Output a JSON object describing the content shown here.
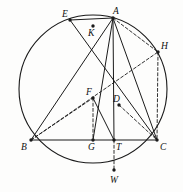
{
  "figure": {
    "background_color": "#fdfdfc",
    "stroke_color": "#1a1a1a",
    "label_color": "#101010"
  },
  "circle": {
    "center_x": 93,
    "center_y": 89,
    "radius": 74,
    "style": "solid"
  },
  "points": [
    {
      "id": "E",
      "label": "E",
      "x": 70,
      "y": 20,
      "label_x": 62,
      "label_y": 10,
      "on_circle": true
    },
    {
      "id": "A",
      "label": "A",
      "x": 113,
      "y": 18,
      "label_x": 113,
      "label_y": 7,
      "on_circle": true
    },
    {
      "id": "K",
      "label": "K",
      "x": 93,
      "y": 26,
      "label_x": 88,
      "label_y": 29,
      "on_circle": false
    },
    {
      "id": "H",
      "label": "H",
      "x": 158,
      "y": 52,
      "label_x": 161,
      "label_y": 42,
      "on_circle": true
    },
    {
      "id": "F",
      "label": "F",
      "x": 93,
      "y": 98,
      "label_x": 86,
      "label_y": 88,
      "on_circle": false
    },
    {
      "id": "D",
      "label": "D",
      "x": 119,
      "y": 105,
      "label_x": 113,
      "label_y": 95,
      "on_circle": false
    },
    {
      "id": "B",
      "label": "B",
      "x": 31,
      "y": 140,
      "label_x": 21,
      "label_y": 143,
      "on_circle": true
    },
    {
      "id": "G",
      "label": "G",
      "x": 93,
      "y": 140,
      "label_x": 88,
      "label_y": 143,
      "on_circle": false
    },
    {
      "id": "T",
      "label": "T",
      "x": 114,
      "y": 140,
      "label_x": 116,
      "label_y": 143,
      "on_circle": false
    },
    {
      "id": "C",
      "label": "C",
      "x": 157,
      "y": 140,
      "label_x": 160,
      "label_y": 143,
      "on_circle": true
    },
    {
      "id": "W",
      "label": "W",
      "x": 114,
      "y": 170,
      "label_x": 110,
      "label_y": 176,
      "on_circle": true
    }
  ],
  "segments": [
    {
      "id": "EA",
      "from": "E",
      "to": "A",
      "style": "solid"
    },
    {
      "id": "EC",
      "from": "E",
      "to": "C",
      "style": "solid"
    },
    {
      "id": "AB",
      "from": "A",
      "to": "B",
      "style": "solid"
    },
    {
      "id": "AT",
      "from": "A",
      "to": "T",
      "style": "solid"
    },
    {
      "id": "AG",
      "from": "A",
      "to": "G",
      "style": "solid"
    },
    {
      "id": "AC",
      "from": "A",
      "to": "C",
      "style": "solid"
    },
    {
      "id": "BC",
      "from": "B",
      "to": "C",
      "style": "solid"
    },
    {
      "id": "FT",
      "from": "F",
      "to": "T",
      "style": "solid"
    },
    {
      "id": "AH",
      "from": "A",
      "to": "H",
      "style": "dashed"
    },
    {
      "id": "HC",
      "from": "H",
      "to": "C",
      "style": "dashed"
    },
    {
      "id": "BH",
      "from": "B",
      "to": "H",
      "style": "dashed"
    },
    {
      "id": "BF",
      "from": "B",
      "to": "F",
      "style": "dashed"
    },
    {
      "id": "FG",
      "from": "F",
      "to": "G",
      "style": "dashed"
    },
    {
      "id": "DC",
      "from": "D",
      "to": "C",
      "style": "dashed"
    },
    {
      "id": "TW",
      "from": "T",
      "to": "W",
      "style": "dashed"
    }
  ]
}
